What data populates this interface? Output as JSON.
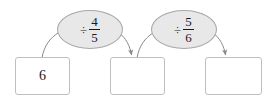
{
  "diagram": {
    "type": "function-machine-flowchart",
    "background_color": "#ffffff",
    "box_border_color": "#bfbfbf",
    "ellipse_fill_color": "#e8e8e8",
    "ellipse_border_color": "#a8a8a8",
    "arrow_color": "#8a8a8a",
    "text_color": "#1a1a1a",
    "boxes": [
      {
        "id": "box-1",
        "label": "6",
        "empty": false
      },
      {
        "id": "box-2",
        "label": "",
        "empty": true
      },
      {
        "id": "box-3",
        "label": "",
        "empty": true
      }
    ],
    "operations": [
      {
        "id": "op-1",
        "symbol": "÷",
        "numerator": "4",
        "denominator": "5",
        "text": "÷ 4/5"
      },
      {
        "id": "op-2",
        "symbol": "÷",
        "numerator": "5",
        "denominator": "6",
        "text": "÷ 5/6"
      }
    ],
    "arrows": [
      {
        "id": "arrow-1",
        "from": "box-1",
        "to": "op-1",
        "has_arrowhead": false
      },
      {
        "id": "arrow-2",
        "from": "op-1",
        "to": "box-2",
        "has_arrowhead": true
      },
      {
        "id": "arrow-3",
        "from": "box-2",
        "to": "op-2",
        "has_arrowhead": false
      },
      {
        "id": "arrow-4",
        "from": "op-2",
        "to": "box-3",
        "has_arrowhead": true
      }
    ]
  }
}
